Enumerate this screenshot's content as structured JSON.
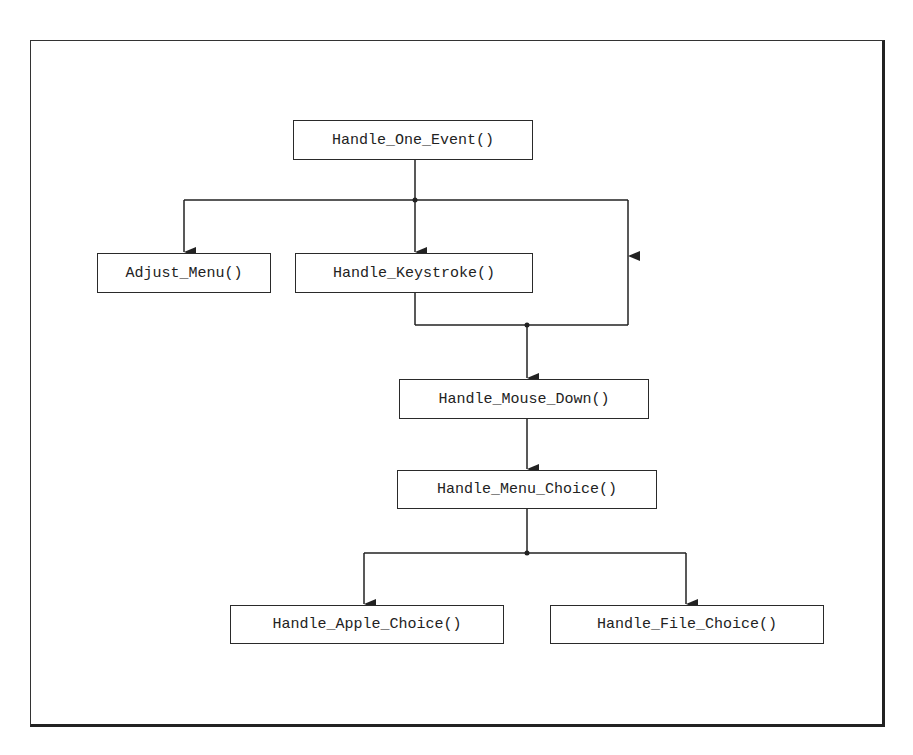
{
  "diagram": {
    "type": "call-hierarchy",
    "nodes": [
      {
        "id": "handle_one_event",
        "label": "Handle_One_Event()"
      },
      {
        "id": "adjust_menu",
        "label": "Adjust_Menu()"
      },
      {
        "id": "handle_keystroke",
        "label": "Handle_Keystroke()"
      },
      {
        "id": "handle_mouse_down",
        "label": "Handle_Mouse_Down()"
      },
      {
        "id": "handle_menu_choice",
        "label": "Handle_Menu_Choice()"
      },
      {
        "id": "handle_apple_choice",
        "label": "Handle_Apple_Choice()"
      },
      {
        "id": "handle_file_choice",
        "label": "Handle_File_Choice()"
      }
    ],
    "edges": [
      {
        "from": "handle_one_event",
        "to": "adjust_menu"
      },
      {
        "from": "handle_one_event",
        "to": "handle_keystroke"
      },
      {
        "from": "handle_one_event",
        "to": "handle_mouse_down"
      },
      {
        "from": "handle_keystroke",
        "to": "handle_mouse_down"
      },
      {
        "from": "handle_mouse_down",
        "to": "handle_menu_choice"
      },
      {
        "from": "handle_menu_choice",
        "to": "handle_apple_choice"
      },
      {
        "from": "handle_menu_choice",
        "to": "handle_file_choice"
      }
    ],
    "colors": {
      "line": "#222222",
      "background": "#ffffff"
    }
  }
}
